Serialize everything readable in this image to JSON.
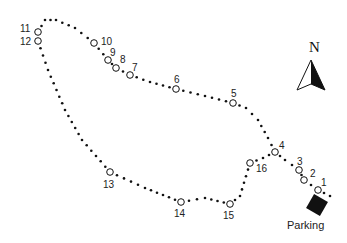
{
  "map": {
    "colors": {
      "trail": "#111111",
      "text": "#222222",
      "background": "#ffffff",
      "parking": "#111111"
    },
    "compass": {
      "label": "N"
    },
    "parking": {
      "label": "Parking",
      "x": 317,
      "y": 205
    },
    "trail_path": [
      [
        330,
        196
      ],
      [
        318,
        190
      ],
      [
        304,
        180
      ],
      [
        299,
        170
      ],
      [
        285,
        160
      ],
      [
        275,
        152
      ],
      [
        268,
        138
      ],
      [
        258,
        120
      ],
      [
        246,
        108
      ],
      [
        233,
        103
      ],
      [
        205,
        96
      ],
      [
        176,
        89
      ],
      [
        150,
        82
      ],
      [
        130,
        75
      ],
      [
        116,
        68
      ],
      [
        108,
        60
      ],
      [
        94,
        43
      ],
      [
        75,
        28
      ],
      [
        56,
        20
      ],
      [
        45,
        20
      ],
      [
        38,
        32
      ],
      [
        38,
        41
      ],
      [
        48,
        70
      ],
      [
        65,
        110
      ],
      [
        82,
        140
      ],
      [
        110,
        172
      ],
      [
        145,
        188
      ],
      [
        181,
        202
      ],
      [
        205,
        198
      ],
      [
        230,
        204
      ],
      [
        240,
        196
      ],
      [
        250,
        163
      ],
      [
        263,
        158
      ],
      [
        275,
        152
      ]
    ],
    "stops": [
      {
        "id": "1",
        "x": 318,
        "y": 190,
        "lx": 321,
        "ly": 186
      },
      {
        "id": "2",
        "x": 304,
        "y": 180,
        "lx": 310,
        "ly": 177
      },
      {
        "id": "3",
        "x": 299,
        "y": 170,
        "lx": 297,
        "ly": 165
      },
      {
        "id": "4",
        "x": 275,
        "y": 152,
        "lx": 279,
        "ly": 149
      },
      {
        "id": "5",
        "x": 233,
        "y": 103,
        "lx": 231,
        "ly": 97
      },
      {
        "id": "6",
        "x": 176,
        "y": 89,
        "lx": 174,
        "ly": 83
      },
      {
        "id": "7",
        "x": 130,
        "y": 75,
        "lx": 132,
        "ly": 71
      },
      {
        "id": "8",
        "x": 116,
        "y": 68,
        "lx": 120,
        "ly": 63
      },
      {
        "id": "9",
        "x": 108,
        "y": 60,
        "lx": 110,
        "ly": 56
      },
      {
        "id": "10",
        "x": 94,
        "y": 43,
        "lx": 101,
        "ly": 45
      },
      {
        "id": "11",
        "x": 38,
        "y": 32,
        "lx": 20,
        "ly": 32
      },
      {
        "id": "12",
        "x": 38,
        "y": 41,
        "lx": 20,
        "ly": 45
      },
      {
        "id": "13",
        "x": 110,
        "y": 172,
        "lx": 103,
        "ly": 188
      },
      {
        "id": "14",
        "x": 181,
        "y": 202,
        "lx": 174,
        "ly": 217
      },
      {
        "id": "15",
        "x": 230,
        "y": 204,
        "lx": 223,
        "ly": 219
      },
      {
        "id": "16",
        "x": 250,
        "y": 163,
        "lx": 256,
        "ly": 172
      }
    ]
  }
}
